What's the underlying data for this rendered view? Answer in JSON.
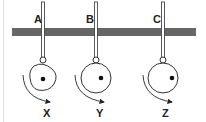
{
  "diagram": {
    "bar_color": "#666666",
    "pivots": [
      {
        "label": "A",
        "object_label": "X",
        "object_shape": "rounded-square",
        "center_of_mass": "center"
      },
      {
        "label": "B",
        "object_label": "Y",
        "object_shape": "circle",
        "center_of_mass": "off-center right"
      },
      {
        "label": "C",
        "object_label": "Z",
        "object_shape": "circle",
        "center_of_mass": "off-center far right"
      }
    ]
  }
}
